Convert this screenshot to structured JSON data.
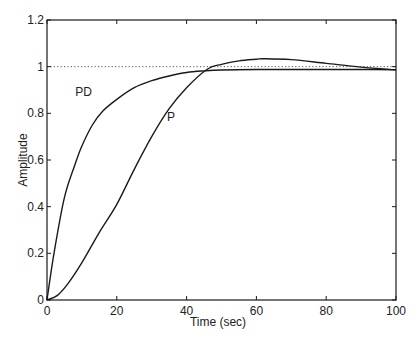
{
  "chart_data": {
    "type": "line",
    "title": "",
    "xlabel": "Time (sec)",
    "ylabel": "Amplitude",
    "xlim": [
      0,
      100
    ],
    "ylim": [
      0,
      1.2
    ],
    "xticks": [
      0,
      20,
      40,
      60,
      80,
      100
    ],
    "xtick_labels": [
      "0",
      "20",
      "40",
      "60",
      "80",
      "100"
    ],
    "yticks": [
      0,
      0.2,
      0.4,
      0.6,
      0.8,
      1,
      1.2
    ],
    "ytick_labels": [
      "0",
      "0.2",
      "0.4",
      "0.6",
      "0.8",
      "1",
      "1.2"
    ],
    "grid": false,
    "reference_line": {
      "y": 1,
      "style": "dotted"
    },
    "annotations": [
      {
        "text": "PD",
        "x": 10.5,
        "y": 0.895
      },
      {
        "text": "P",
        "x": 35.5,
        "y": 0.79
      }
    ],
    "series": [
      {
        "name": "PD",
        "x": [
          0,
          2,
          5,
          8,
          10,
          13,
          16,
          20,
          25,
          30,
          35,
          40,
          45,
          50,
          60,
          70,
          80,
          90,
          100
        ],
        "values": [
          0,
          0.2,
          0.44,
          0.58,
          0.66,
          0.75,
          0.81,
          0.86,
          0.91,
          0.94,
          0.96,
          0.975,
          0.982,
          0.986,
          0.988,
          0.988,
          0.988,
          0.988,
          0.987
        ]
      },
      {
        "name": "P",
        "x": [
          0,
          3,
          6,
          10,
          15,
          20,
          25,
          30,
          35,
          40,
          46,
          50,
          55,
          60,
          62,
          70,
          80,
          90,
          100
        ],
        "values": [
          0,
          0.02,
          0.07,
          0.16,
          0.29,
          0.41,
          0.56,
          0.7,
          0.82,
          0.91,
          0.99,
          1.01,
          1.025,
          1.032,
          1.034,
          1.03,
          1.014,
          0.998,
          0.986
        ]
      }
    ]
  }
}
